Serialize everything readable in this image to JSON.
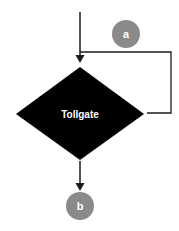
{
  "diagram": {
    "type": "flowchart",
    "nodes": {
      "connector_a": {
        "label": "a",
        "shape": "circle",
        "color": "#8a8a8a"
      },
      "tollgate": {
        "label": "Tollgate",
        "shape": "diamond",
        "color": "#000000"
      },
      "connector_b": {
        "label": "b",
        "shape": "circle",
        "color": "#8a8a8a"
      }
    },
    "edges": [
      {
        "from": "start",
        "to": "tollgate",
        "label": ""
      },
      {
        "from": "tollgate",
        "to": "tollgate",
        "label": "",
        "note": "loop back from right vertex to top entry"
      },
      {
        "from": "tollgate",
        "to": "connector_b",
        "label": ""
      }
    ],
    "colors": {
      "line": "#1a1a1a",
      "decision_fill": "#000000",
      "connector_fill": "#8a8a8a",
      "text_on_dark": "#ffffff"
    }
  }
}
